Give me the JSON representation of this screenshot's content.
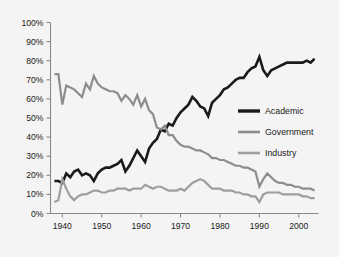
{
  "chart_data": {
    "type": "line",
    "title": "",
    "subtitle": "",
    "xlabel": "",
    "ylabel": "",
    "xlim": [
      1937,
      2005
    ],
    "ylim": [
      0,
      100
    ],
    "grid": false,
    "legend_position": "right-middle",
    "y_ticks": [
      "0%",
      "10%",
      "20%",
      "30%",
      "40%",
      "50%",
      "60%",
      "70%",
      "80%",
      "90%",
      "100%"
    ],
    "y_tick_values": [
      0,
      10,
      20,
      30,
      40,
      50,
      60,
      70,
      80,
      90,
      100
    ],
    "x_ticks": [
      "1940",
      "1950",
      "1960",
      "1970",
      "1980",
      "1990",
      "2000"
    ],
    "x_tick_values": [
      1940,
      1950,
      1960,
      1970,
      1980,
      1990,
      2000
    ],
    "x": [
      1938,
      1939,
      1940,
      1941,
      1942,
      1943,
      1944,
      1945,
      1946,
      1947,
      1948,
      1949,
      1950,
      1951,
      1952,
      1953,
      1954,
      1955,
      1956,
      1957,
      1958,
      1959,
      1960,
      1961,
      1962,
      1963,
      1964,
      1965,
      1966,
      1967,
      1968,
      1969,
      1970,
      1971,
      1972,
      1973,
      1974,
      1975,
      1976,
      1977,
      1978,
      1979,
      1980,
      1981,
      1982,
      1983,
      1984,
      1985,
      1986,
      1987,
      1988,
      1989,
      1990,
      1991,
      1992,
      1993,
      1994,
      1995,
      1996,
      1997,
      1998,
      1999,
      2000,
      2001,
      2002,
      2003,
      2004
    ],
    "series": [
      {
        "name": "Academic",
        "color": "#1a1a1a",
        "width": 2.6,
        "values": [
          17,
          17,
          16,
          21,
          19,
          22,
          23,
          20,
          21,
          20,
          17,
          21,
          23,
          24,
          24,
          25,
          26,
          28,
          22,
          25,
          29,
          33,
          30,
          27,
          34,
          37,
          39,
          44,
          43,
          47,
          46,
          50,
          53,
          55,
          57,
          61,
          59,
          56,
          55,
          51,
          58,
          60,
          62,
          65,
          66,
          68,
          70,
          71,
          71,
          74,
          76,
          77,
          82,
          75,
          72,
          75,
          76,
          77,
          78,
          79,
          79,
          79,
          79,
          79,
          80,
          79,
          81
        ]
      },
      {
        "name": "Government",
        "color": "#8d8d8d",
        "width": 2.2,
        "values": [
          73,
          73,
          57,
          67,
          66,
          65,
          63,
          61,
          68,
          65,
          72,
          68,
          66,
          65,
          64,
          64,
          63,
          59,
          62,
          60,
          57,
          62,
          56,
          60,
          54,
          52,
          45,
          44,
          46,
          41,
          41,
          38,
          36,
          35,
          35,
          34,
          33,
          33,
          32,
          31,
          29,
          29,
          28,
          28,
          27,
          26,
          25,
          25,
          24,
          24,
          23,
          22,
          14,
          18,
          21,
          19,
          17,
          16,
          16,
          15,
          15,
          14,
          14,
          13,
          13,
          13,
          12
        ]
      },
      {
        "name": "Industry",
        "color": "#9e9e9e",
        "width": 2.2,
        "values": [
          6,
          7,
          18,
          13,
          9,
          7,
          9,
          10,
          10,
          11,
          12,
          12,
          11,
          11,
          12,
          12,
          13,
          13,
          13,
          12,
          13,
          13,
          13,
          15,
          14,
          13,
          14,
          14,
          13,
          12,
          12,
          12,
          13,
          12,
          14,
          16,
          17,
          18,
          17,
          15,
          13,
          13,
          13,
          12,
          12,
          12,
          11,
          11,
          10,
          10,
          9,
          9,
          6,
          10,
          11,
          11,
          11,
          11,
          10,
          10,
          10,
          10,
          10,
          9,
          9,
          8,
          8
        ]
      }
    ],
    "legend": [
      {
        "label": "Academic",
        "color": "#1a1a1a"
      },
      {
        "label": "Government",
        "color": "#8d8d8d"
      },
      {
        "label": "Industry",
        "color": "#9e9e9e"
      }
    ]
  }
}
